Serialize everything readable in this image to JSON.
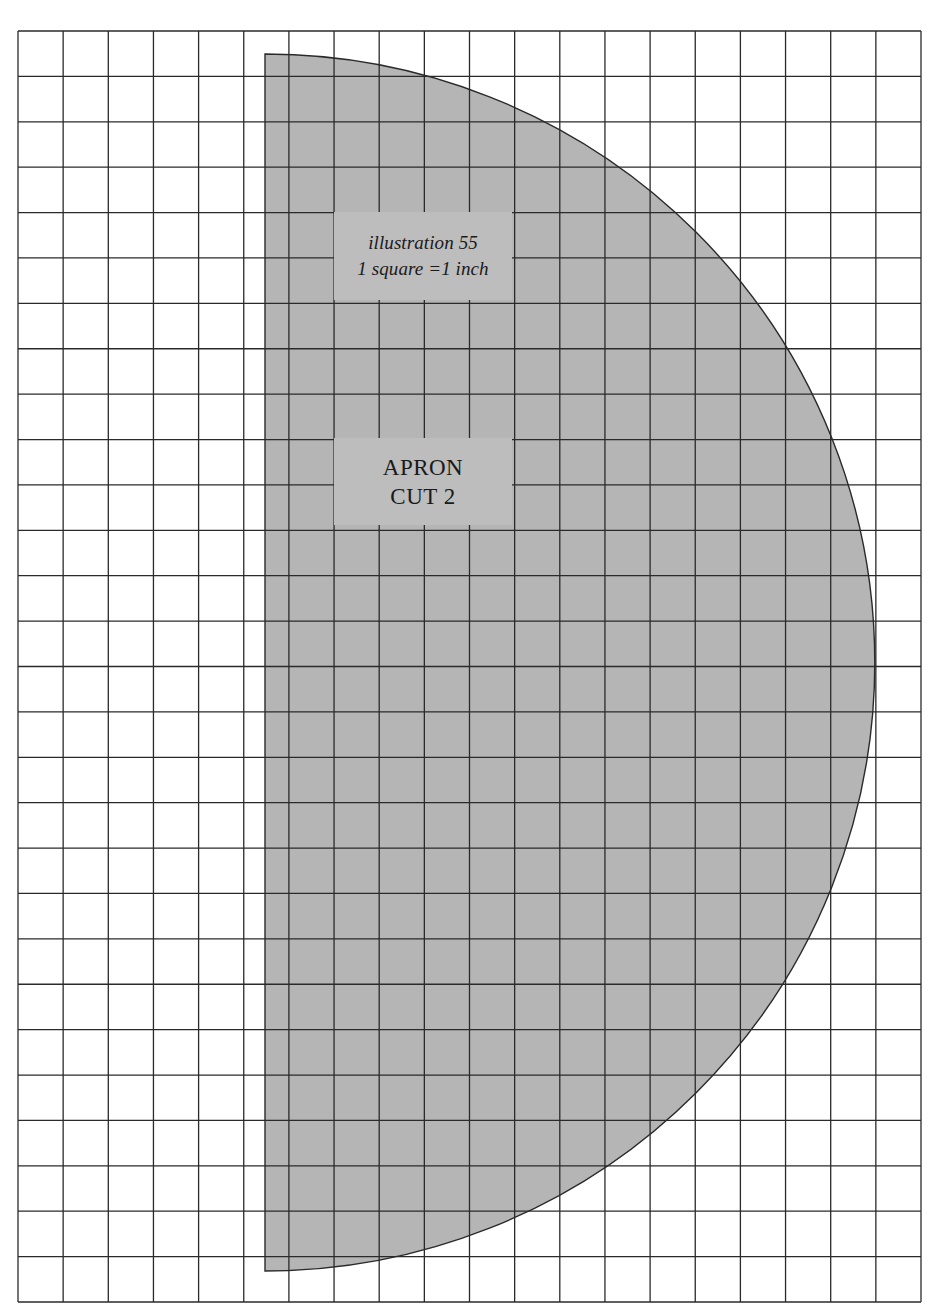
{
  "diagram": {
    "type": "sewing-pattern",
    "grid": {
      "columns": 20,
      "rows": 28,
      "left": 18,
      "top": 31,
      "right": 921,
      "bottom": 1302,
      "line_color": "#2a2a2a"
    },
    "piece": {
      "name": "apron",
      "shape": "half-circle",
      "flat_edge_x": 265,
      "top_y": 54,
      "bottom_y": 1271,
      "arc_rightmost_x": 875,
      "fill_color": "#b5b5b5",
      "outline_color": "#2a2a2a"
    },
    "caption": {
      "line1": "illustration 55",
      "line2": "1 square =1 inch"
    },
    "piece_label": {
      "line1": "APRON",
      "line2": "CUT 2"
    },
    "label_fill_color": "#bdbdbd"
  }
}
